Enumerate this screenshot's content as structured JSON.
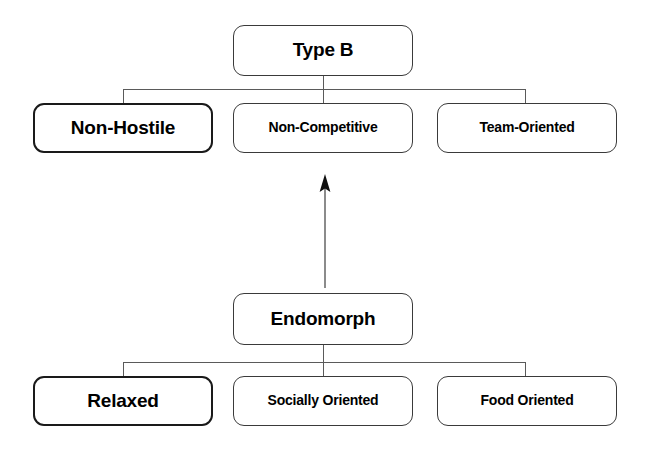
{
  "diagram": {
    "background_color": "#ffffff",
    "border_color": "#3a3a3a",
    "text_color": "#000000",
    "connector_color": "#5a5a5a",
    "top_tree": {
      "root": {
        "label": "Type B",
        "emphasis": false
      },
      "children": [
        {
          "label": "Non-Hostile",
          "emphasis": true
        },
        {
          "label": "Non-Competitive",
          "emphasis": false
        },
        {
          "label": "Team-Oriented",
          "emphasis": false
        }
      ]
    },
    "bottom_tree": {
      "root": {
        "label": "Endomorph",
        "emphasis": false
      },
      "children": [
        {
          "label": "Relaxed",
          "emphasis": true
        },
        {
          "label": "Socially Oriented",
          "emphasis": false
        },
        {
          "label": "Food Oriented",
          "emphasis": false
        }
      ]
    },
    "link": {
      "icon": "up-arrow-icon",
      "direction": "up",
      "from": "Endomorph",
      "to": "Non-Competitive"
    }
  }
}
